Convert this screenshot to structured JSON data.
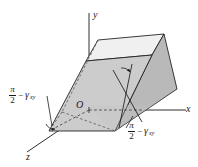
{
  "figure": {
    "background_color": "#ffffff",
    "stroke_color": "#1a1a1a",
    "face_front_color": "#c9c9c9",
    "face_right_color": "#b8b8b8",
    "face_top_color": "#efefef",
    "face_base_color": "#d4d4d4"
  },
  "axes": {
    "y_label": "y",
    "x_label": "x",
    "z_label": "z",
    "origin_label": "O"
  },
  "annotations": {
    "left_angle": {
      "numerator": "π",
      "denominator": "2",
      "operator": "−",
      "symbol": "γ",
      "subscript": "xy",
      "full_text": "π/2 − γxy"
    },
    "right_angle": {
      "numerator": "π",
      "denominator": "2",
      "operator": "−",
      "symbol": "γ",
      "subscript": "xy",
      "full_text": "π/2 − γxy"
    }
  }
}
